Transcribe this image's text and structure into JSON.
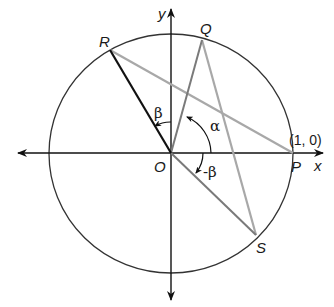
{
  "diagram": {
    "type": "unit-circle-angle-construction",
    "axes": {
      "x_label": "x",
      "y_label": "y"
    },
    "points": {
      "origin": {
        "label": "O"
      },
      "P": {
        "label": "P",
        "coord_label": "(1, 0)"
      },
      "Q": {
        "label": "Q"
      },
      "R": {
        "label": "R"
      },
      "S": {
        "label": "S"
      }
    },
    "angles": {
      "alpha": "α",
      "beta": "β",
      "neg_beta": "-β"
    },
    "colors": {
      "axis": "#111111",
      "circle": "#333333",
      "segment_OR": "#111111",
      "segment_OQ": "#7a7a7a",
      "segment_OS": "#7a7a7a",
      "segment_RP": "#a8a8a8",
      "segment_QS": "#a8a8a8"
    }
  }
}
